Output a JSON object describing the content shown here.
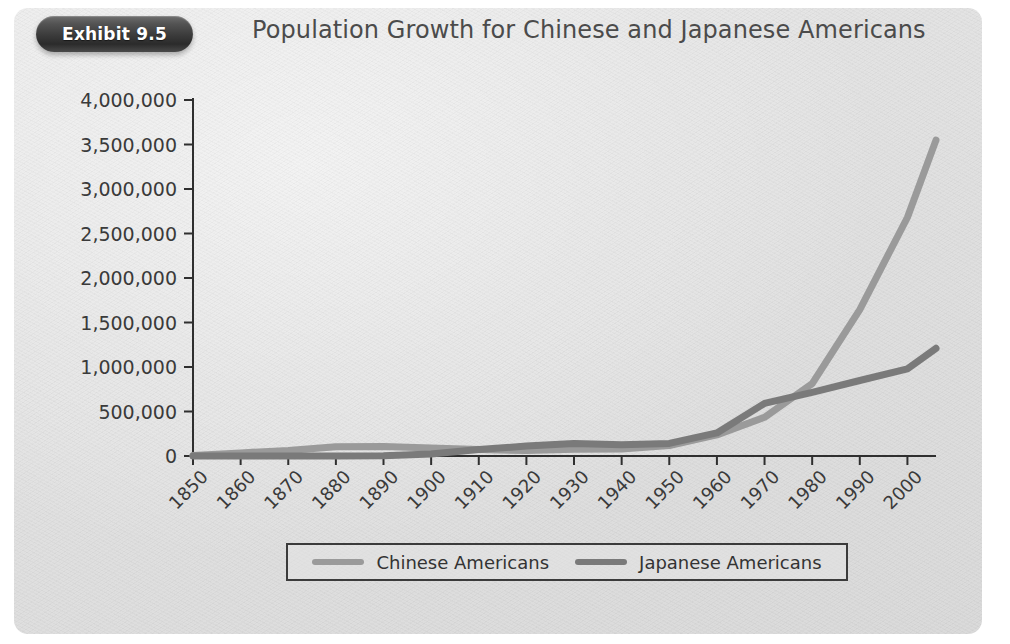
{
  "header": {
    "badge_label": "Exhibit 9.5",
    "title": "Population Growth for Chinese and Japanese Americans"
  },
  "legend": {
    "position": "bottom",
    "items": [
      {
        "label": "Chinese Americans",
        "color": "#9a9a9a"
      },
      {
        "label": "Japanese Americans",
        "color": "#7a7a7a"
      }
    ]
  },
  "colors": {
    "panel_background": "#e2e2e2",
    "axis": "#2f2f2f",
    "text": "#3a3a3a",
    "badge": "#3c3c3c",
    "title": "#4b4b4b",
    "chinese_series": "#9a9a9a",
    "japanese_series": "#7a7a7a"
  },
  "chart_data": {
    "type": "line",
    "title": "Population Growth for Chinese and Japanese Americans",
    "xlabel": "",
    "ylabel": "",
    "grid": false,
    "legend_position": "bottom",
    "x": [
      1850,
      1860,
      1870,
      1880,
      1890,
      1900,
      1910,
      1920,
      1930,
      1940,
      1950,
      1960,
      1970,
      1980,
      1990,
      2000,
      2006
    ],
    "xtick_labels": [
      "1850",
      "1860",
      "1870",
      "1880",
      "1890",
      "1900",
      "1910",
      "1920",
      "1930",
      "1940",
      "1950",
      "1960",
      "1970",
      "1980",
      "1990",
      "2000"
    ],
    "xlim": [
      1850,
      2006
    ],
    "ylim": [
      0,
      4000000
    ],
    "ytick_labels": [
      "0",
      "500,000",
      "1,000,000",
      "1,500,000",
      "2,000,000",
      "2,500,000",
      "3,000,000",
      "3,500,000",
      "4,000,000"
    ],
    "ytick_values": [
      0,
      500000,
      1000000,
      1500000,
      2000000,
      2500000,
      3000000,
      3500000,
      4000000
    ],
    "series": [
      {
        "name": "Chinese Americans",
        "color": "#9a9a9a",
        "values": [
          4000,
          35000,
          63000,
          105000,
          107000,
          90000,
          72000,
          62000,
          75000,
          78000,
          118000,
          237000,
          435000,
          812000,
          1645000,
          2680000,
          3550000
        ]
      },
      {
        "name": "Japanese Americans",
        "color": "#7a7a7a",
        "values": [
          0,
          0,
          60,
          150,
          2000,
          24000,
          72000,
          111000,
          139000,
          127000,
          142000,
          260000,
          591000,
          716000,
          848000,
          980000,
          1210000
        ]
      }
    ]
  }
}
